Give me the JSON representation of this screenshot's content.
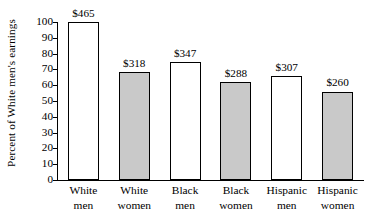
{
  "chart_data": {
    "type": "bar",
    "title": "",
    "xlabel": "",
    "ylabel": "Percent of White men's earnings",
    "ylim": [
      0,
      100
    ],
    "yticks": [
      0,
      10,
      20,
      30,
      40,
      50,
      60,
      70,
      80,
      90,
      100
    ],
    "ytick_labels": [
      "0",
      "10",
      "20",
      "30",
      "40",
      "50",
      "60",
      "70",
      "80",
      "90",
      "100"
    ],
    "grid": false,
    "legend": "none",
    "categories": [
      "White men",
      "White women",
      "Black men",
      "Black women",
      "Hispanic men",
      "Hispanic women"
    ],
    "category_lines": [
      {
        "line1": "White",
        "line2": "men"
      },
      {
        "line1": "White",
        "line2": "women"
      },
      {
        "line1": "Black",
        "line2": "men"
      },
      {
        "line1": "Black",
        "line2": "women"
      },
      {
        "line1": "Hispanic",
        "line2": "men"
      },
      {
        "line1": "Hispanic",
        "line2": "women"
      }
    ],
    "values": [
      100.0,
      68.4,
      74.6,
      61.9,
      66.0,
      55.9
    ],
    "data_labels": [
      "$465",
      "$318",
      "$347",
      "$288",
      "$307",
      "$260"
    ],
    "dollar_values": [
      465,
      318,
      347,
      288,
      307,
      260
    ],
    "bar_styles": [
      "white",
      "gray",
      "white",
      "gray",
      "white",
      "gray"
    ],
    "colors": {
      "bar_white_fill": "#ffffff",
      "bar_gray_fill": "#c9c9c9",
      "bar_outline": "#000000",
      "axis": "#000000",
      "text": "#000000",
      "background": "#ffffff"
    }
  }
}
